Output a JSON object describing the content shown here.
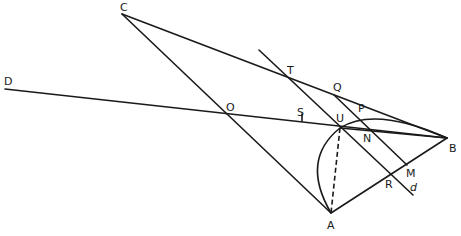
{
  "figure": {
    "type": "geometric construction",
    "points": {
      "A": "A",
      "B": "B",
      "C": "C",
      "D": "D",
      "O": "O",
      "S": "S",
      "T": "T",
      "Q": "Q",
      "P": "P",
      "U": "U",
      "N": "N",
      "M": "M",
      "R": "R",
      "d": "d"
    },
    "segments": [
      "CA",
      "CB",
      "AB",
      "DB",
      "T-d line",
      "QM",
      "UA (dashed)"
    ],
    "arcs": [
      "A-U arc",
      "U-B arc"
    ],
    "stroke_color": "#1a1a1a",
    "background": "#ffffff"
  }
}
